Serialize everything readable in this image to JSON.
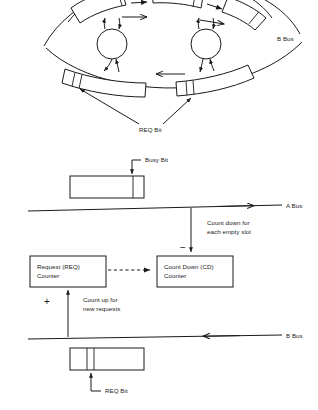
{
  "figure": {
    "ink_color": "#1a1a1a",
    "paper_color": "#ffffff"
  },
  "ring_diagram": {
    "name": "slotted-ring-diagram",
    "b_bus_label": "B Bus",
    "req_bit_label": "REQ Bit",
    "node_count": 2,
    "upper_slot_count": 3,
    "lower_slot_count": 2
  },
  "linear_diagram": {
    "name": "counter-mechanism-diagram",
    "busy_bit_label": "Busy Bit",
    "a_bus_label": "A Bus",
    "b_bus_label": "B Bus",
    "req_bit_label": "REQ Bit",
    "count_down_note_line1": "Count down for",
    "count_down_note_line2": "each empty slot",
    "count_up_note_line1": "Count up for",
    "count_up_note_line2": "new requests",
    "minus_sign": "−",
    "plus_sign": "+",
    "req_counter": {
      "line1": "Request (REQ)",
      "line2": "Counter"
    },
    "cd_counter": {
      "line1": "Count Down (CD)",
      "line2": "Counter"
    }
  }
}
